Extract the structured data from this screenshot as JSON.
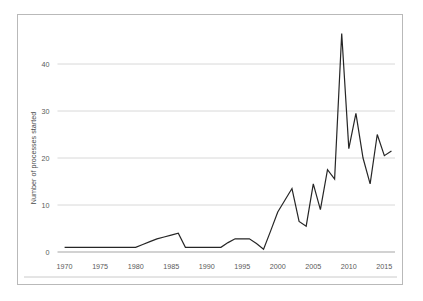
{
  "chart_data": {
    "type": "line",
    "title": "",
    "subtitle": "",
    "xlabel": "",
    "ylabel": "Number of processes started",
    "x": [
      1970,
      1971,
      1972,
      1973,
      1974,
      1975,
      1976,
      1977,
      1978,
      1979,
      1980,
      1981,
      1982,
      1983,
      1984,
      1985,
      1986,
      1987,
      1988,
      1989,
      1990,
      1991,
      1992,
      1993,
      1994,
      1995,
      1996,
      1997,
      1998,
      1999,
      2000,
      2001,
      2002,
      2003,
      2004,
      2005,
      2006,
      2007,
      2008,
      2009,
      2010,
      2011,
      2012,
      2013,
      2014,
      2015,
      2016
    ],
    "values": [
      1,
      1,
      1,
      1,
      1,
      1,
      1,
      1,
      1,
      1,
      1,
      1.6,
      2.2,
      2.8,
      3.2,
      3.6,
      4,
      1,
      1,
      1,
      1,
      1,
      1,
      2,
      2.8,
      2.8,
      2.8,
      1.8,
      0.6,
      4.5,
      8.5,
      11,
      13.5,
      6.5,
      5.5,
      14.5,
      9,
      17.5,
      15.5,
      46.5,
      22,
      29.5,
      20,
      14.5,
      25,
      20.5,
      21.5
    ],
    "series": [
      {
        "name": "Number of processes started",
        "values": [
          1,
          1,
          1,
          1,
          1,
          1,
          1,
          1,
          1,
          1,
          1,
          1.6,
          2.2,
          2.8,
          3.2,
          3.6,
          4,
          1,
          1,
          1,
          1,
          1,
          1,
          2,
          2.8,
          2.8,
          2.8,
          1.8,
          0.6,
          4.5,
          8.5,
          11,
          13.5,
          6.5,
          5.5,
          14.5,
          9,
          17.5,
          15.5,
          46.5,
          22,
          29.5,
          20,
          14.5,
          25,
          20.5,
          21.5
        ],
        "color": "#262626"
      }
    ],
    "xlim": [
      1969,
      2016.5
    ],
    "ylim": [
      0,
      48
    ],
    "xticks": [
      1970,
      1975,
      1980,
      1985,
      1990,
      1995,
      2000,
      2005,
      2010,
      2015
    ],
    "xtick_labels": [
      "1970",
      "1975",
      "1980",
      "1985",
      "1990",
      "1995",
      "2000",
      "2005",
      "2010",
      "2015"
    ],
    "yticks": [
      0,
      10,
      20,
      30,
      40
    ],
    "ytick_labels": [
      "0",
      "10",
      "20",
      "30",
      "40"
    ],
    "grid": {
      "horizontal": true,
      "vertical": false,
      "color": "#d4d4d4"
    },
    "legend": {
      "visible": false,
      "position": "none"
    },
    "line_color": "#262626",
    "line_width": 1.2,
    "plot_background": "#ffffff",
    "border_color": "#b9b9b9",
    "tick_label_color": "#5a5a5a",
    "axis_title_color": "#4a4a4a"
  }
}
